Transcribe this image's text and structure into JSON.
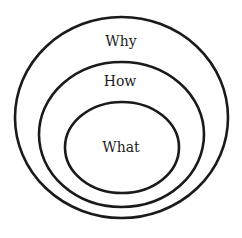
{
  "diagram": {
    "type": "nested-ellipses",
    "stroke_color": "#1a1a1a",
    "background": "#ffffff",
    "layers": [
      {
        "label": "Why",
        "level": "outer"
      },
      {
        "label": "How",
        "level": "middle"
      },
      {
        "label": "What",
        "level": "inner"
      }
    ]
  }
}
